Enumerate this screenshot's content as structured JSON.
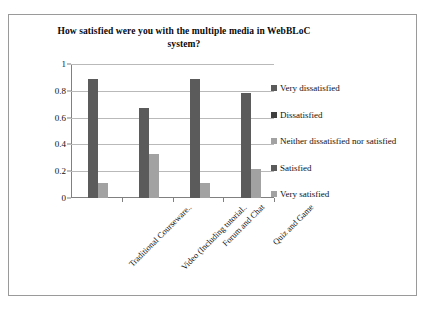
{
  "chart_data": {
    "type": "bar",
    "title": "How satisfied were you with the multiple media in WebBLoC system?",
    "xlabel": "",
    "ylabel": "",
    "ylim": [
      0,
      1
    ],
    "yticks": [
      "0",
      "0.2",
      "0.4",
      "0.6",
      "0.8",
      "1"
    ],
    "ytick_values": [
      0,
      0.2,
      0.4,
      0.6,
      0.8,
      1
    ],
    "grid": true,
    "legend_position": "right",
    "categories": [
      "Traditional Courseware..",
      "Video (Including tutorial..",
      "Forum and Chat",
      "Quiz and Game"
    ],
    "series": [
      {
        "name": "Very dissatisfied",
        "color": "#5b5b5b",
        "values": [
          0,
          0,
          0,
          0
        ]
      },
      {
        "name": "Dissatisfied",
        "color": "#3f3f3f",
        "values": [
          0,
          0,
          0,
          0
        ]
      },
      {
        "name": "Neither dissatisfied nor satisfied",
        "color": "#a2a2a2",
        "values": [
          0,
          0,
          0,
          0
        ]
      },
      {
        "name": "Satisfied",
        "color": "#5b5b5b",
        "values": [
          0.89,
          0.67,
          0.89,
          0.78
        ]
      },
      {
        "name": "Very satisfied",
        "color": "#a2a2a2",
        "values": [
          0.11,
          0.33,
          0.11,
          0.22
        ]
      }
    ]
  },
  "legend": {
    "items": [
      {
        "label": "Very dissatisfied",
        "color": "#5b5b5b"
      },
      {
        "label": "Dissatisfied",
        "color": "#3f3f3f"
      },
      {
        "label": "Neither dissatisfied nor satisfied",
        "color": "#a2a2a2"
      },
      {
        "label": "Satisfied",
        "color": "#5b5b5b"
      },
      {
        "label": "Very satisfied",
        "color": "#a2a2a2"
      }
    ]
  }
}
